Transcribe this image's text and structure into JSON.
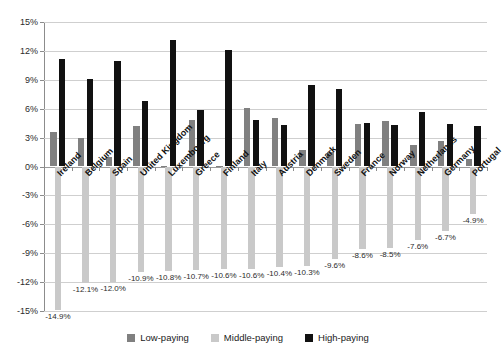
{
  "chart_data": {
    "type": "bar",
    "title": "",
    "subtitle": "",
    "xlabel": "",
    "ylabel": "",
    "ylim": [
      -15,
      15
    ],
    "ytick_labels": [
      "15%",
      "12%",
      "9%",
      "6%",
      "3%",
      "0%",
      "-3%",
      "-6%",
      "-9%",
      "-12%",
      "-15%"
    ],
    "ytick_values": [
      15,
      12,
      9,
      6,
      3,
      0,
      -3,
      -6,
      -9,
      -12,
      -15
    ],
    "grid": true,
    "legend_position": "bottom",
    "categories": [
      "Ireland",
      "Belgium",
      "Spain",
      "United Kingdom",
      "Luxembourg",
      "Greece",
      "Finland",
      "Italy",
      "Austria",
      "Denmark",
      "Sweden",
      "France",
      "Norway",
      "Netherlands",
      "Germany",
      "Portugal"
    ],
    "series": [
      {
        "name": "Low-paying",
        "color": "#808080",
        "values": [
          3.6,
          3.0,
          1.0,
          4.2,
          0.1,
          4.8,
          0.1,
          6.1,
          5.0,
          1.7,
          1.5,
          4.4,
          4.7,
          2.2,
          2.6,
          0.8
        ]
      },
      {
        "name": "Middle-paying",
        "color": "#c9c9c9",
        "values": [
          -14.9,
          -12.1,
          -12.0,
          -10.9,
          -10.8,
          -10.7,
          -10.6,
          -10.6,
          -10.4,
          -10.3,
          -9.6,
          -8.6,
          -8.5,
          -7.6,
          -6.7,
          -4.9
        ]
      },
      {
        "name": "High-paying",
        "color": "#111111",
        "values": [
          11.2,
          9.1,
          11.0,
          6.8,
          13.1,
          5.9,
          12.1,
          4.8,
          4.3,
          8.5,
          8.0,
          4.5,
          4.3,
          5.7,
          4.4,
          4.2
        ]
      }
    ],
    "middle_value_labels": [
      "-14.9%",
      "-12.1%",
      "-12.0%",
      "-10.9%",
      "-10.8%",
      "-10.7%",
      "-10.6%",
      "-10.6%",
      "-10.4%",
      "-10.3%",
      "-9.6%",
      "-8.6%",
      "-8.5%",
      "-7.6%",
      "-6.7%",
      "-4.9%"
    ]
  },
  "legend": {
    "items": [
      {
        "label": "Low-paying",
        "color": "#808080"
      },
      {
        "label": "Middle-paying",
        "color": "#c9c9c9"
      },
      {
        "label": "High-paying",
        "color": "#111111"
      }
    ]
  }
}
